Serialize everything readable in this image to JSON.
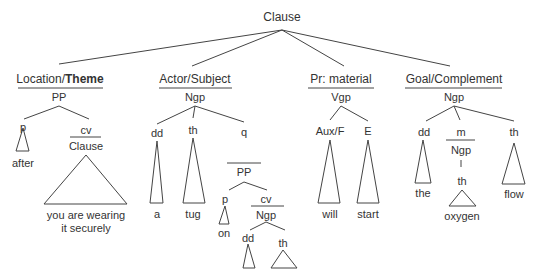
{
  "root": {
    "label": "Clause"
  },
  "constituents": [
    {
      "function_pre": "Location/",
      "function_bold": "Theme",
      "category": "PP",
      "children": [
        {
          "label": "p",
          "word": "after"
        },
        {
          "label": "cv",
          "category": "Clause",
          "words": [
            "you are wearing",
            "it securely"
          ]
        }
      ]
    },
    {
      "function": "Actor/Subject",
      "category": "Ngp",
      "children": [
        {
          "label": "dd",
          "word": "a"
        },
        {
          "label": "th",
          "word": "tug"
        },
        {
          "label": "q",
          "category": "PP",
          "children": [
            {
              "label": "p",
              "word": "on"
            },
            {
              "label": "cv",
              "category": "Ngp",
              "children": [
                {
                  "label": "dd",
                  "word": "the"
                },
                {
                  "label": "th",
                  "word": "hose"
                }
              ]
            }
          ]
        }
      ]
    },
    {
      "function": "Pr: material",
      "category": "Vgp",
      "children": [
        {
          "label": "Aux/F",
          "word": "will"
        },
        {
          "label": "E",
          "word": "start"
        }
      ]
    },
    {
      "function": "Goal/Complement",
      "category": "Ngp",
      "children": [
        {
          "label": "dd",
          "word": "the"
        },
        {
          "label": "m",
          "category": "Ngp",
          "child": {
            "label": "th",
            "word": "oxygen"
          }
        },
        {
          "label": "th",
          "word": "flow"
        }
      ]
    }
  ]
}
